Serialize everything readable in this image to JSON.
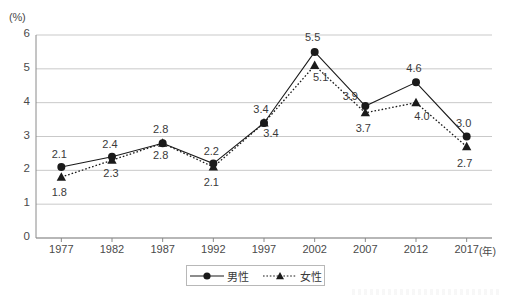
{
  "chart_data": {
    "type": "line",
    "title": "",
    "xlabel": "(年)",
    "ylabel": "(%)",
    "categories": [
      "1977",
      "1982",
      "1987",
      "1992",
      "1997",
      "2002",
      "2007",
      "2012",
      "2017"
    ],
    "ylim": [
      0,
      6
    ],
    "yticks": [
      "0",
      "1",
      "2",
      "3",
      "4",
      "5",
      "6"
    ],
    "grid": true,
    "legend_position": "bottom-center",
    "series": [
      {
        "name": "男性",
        "marker": "circle",
        "line_style": "solid",
        "color": "#1a1a1a",
        "values": [
          2.1,
          2.4,
          2.8,
          2.2,
          3.4,
          5.5,
          3.9,
          4.6,
          3.0
        ],
        "labels": [
          "2.1",
          "2.4",
          "2.8",
          "2.2",
          "3.4",
          "5.5",
          "3.9",
          "4.6",
          "3.0"
        ]
      },
      {
        "name": "女性",
        "marker": "triangle",
        "line_style": "dotted",
        "color": "#1a1a1a",
        "values": [
          1.8,
          2.3,
          2.8,
          2.1,
          3.4,
          5.1,
          3.7,
          4.0,
          2.7
        ],
        "labels": [
          "1.8",
          "2.3",
          "2.8",
          "2.1",
          "3.4",
          "5.1",
          "3.7",
          "4.0",
          "2.7"
        ]
      }
    ]
  },
  "axes": {
    "y_unit": "(%)",
    "x_unit": "(年)"
  },
  "legend": {
    "items": [
      {
        "label": "男性",
        "marker": "circle",
        "line_style": "solid"
      },
      {
        "label": "女性",
        "marker": "triangle",
        "line_style": "dotted"
      }
    ]
  },
  "colors": {
    "grid": "#c9c9c9",
    "axis": "#8a8a8a",
    "ink": "#1a1a1a",
    "text": "#4a4a4a",
    "background": "#ffffff"
  }
}
